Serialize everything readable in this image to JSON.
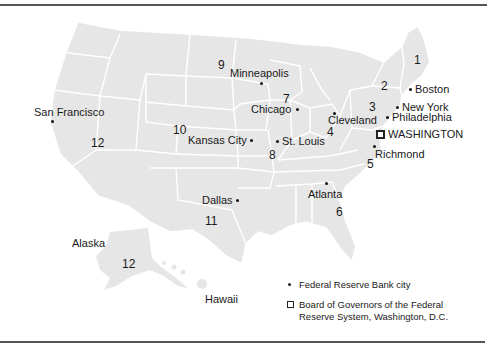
{
  "map": {
    "title": "Federal Reserve Districts",
    "land_color": "#e6e6e6",
    "border_color": "#ffffff",
    "districts": [
      {
        "number": "1",
        "x": 414,
        "y": 54
      },
      {
        "number": "2",
        "x": 381,
        "y": 80
      },
      {
        "number": "3",
        "x": 369,
        "y": 101
      },
      {
        "number": "4",
        "x": 327,
        "y": 126
      },
      {
        "number": "5",
        "x": 367,
        "y": 158
      },
      {
        "number": "6",
        "x": 336,
        "y": 206
      },
      {
        "number": "7",
        "x": 283,
        "y": 93
      },
      {
        "number": "8",
        "x": 269,
        "y": 149
      },
      {
        "number": "9",
        "x": 218,
        "y": 59
      },
      {
        "number": "10",
        "x": 173,
        "y": 124
      },
      {
        "number": "11",
        "x": 205,
        "y": 215
      },
      {
        "number": "12",
        "x": 91,
        "y": 137
      },
      {
        "number": "12",
        "x": 122,
        "y": 258
      }
    ],
    "cities": [
      {
        "name": "San Francisco",
        "dot_x": 51,
        "dot_y": 120,
        "label_x": 34,
        "label_y": 106
      },
      {
        "name": "Minneapolis",
        "dot_x": 260,
        "dot_y": 82,
        "label_x": 230,
        "label_y": 67
      },
      {
        "name": "Chicago",
        "dot_x": 296,
        "dot_y": 108,
        "label_x": 251,
        "label_y": 103
      },
      {
        "name": "Kansas City",
        "dot_x": 250,
        "dot_y": 139,
        "label_x": 188,
        "label_y": 134
      },
      {
        "name": "St. Louis",
        "dot_x": 276,
        "dot_y": 140,
        "label_x": 282,
        "label_y": 135
      },
      {
        "name": "Cleveland",
        "dot_x": 333,
        "dot_y": 112,
        "label_x": 328,
        "label_y": 114
      },
      {
        "name": "Boston",
        "dot_x": 409,
        "dot_y": 88,
        "label_x": 415,
        "label_y": 83
      },
      {
        "name": "New York",
        "dot_x": 396,
        "dot_y": 106,
        "label_x": 402,
        "label_y": 101
      },
      {
        "name": "Philadelphia",
        "dot_x": 386,
        "dot_y": 116,
        "label_x": 392,
        "label_y": 111
      },
      {
        "name": "Richmond",
        "dot_x": 373,
        "dot_y": 145,
        "label_x": 375,
        "label_y": 148
      },
      {
        "name": "Atlanta",
        "dot_x": 325,
        "dot_y": 182,
        "label_x": 308,
        "label_y": 188
      },
      {
        "name": "Dallas",
        "dot_x": 236,
        "dot_y": 199,
        "label_x": 202,
        "label_y": 194
      }
    ],
    "hq": {
      "name": "WASHINGTON",
      "x": 376,
      "y": 130,
      "label_x": 388,
      "label_y": 128
    },
    "regions": [
      {
        "name": "Alaska",
        "x": 72,
        "y": 237
      },
      {
        "name": "Hawaii",
        "x": 205,
        "y": 293
      }
    ]
  },
  "legend": {
    "bank_city": "Federal Reserve Bank city",
    "board_line1": "Board of Governors of the Federal",
    "board_line2": "Reserve System, Washington, D.C."
  }
}
